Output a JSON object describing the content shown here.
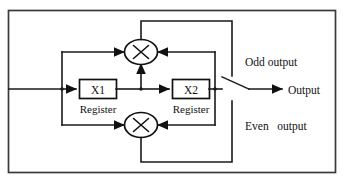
{
  "figure": {
    "kind": "block-diagram",
    "title_text": "",
    "border_color": "#3a3a3a",
    "line_color": "#111111",
    "background": "#ffffff"
  },
  "blocks": {
    "register1": {
      "label": "X1",
      "caption": "Register"
    },
    "register2": {
      "label": "X2",
      "caption": "Register"
    },
    "multiplier_top": {
      "symbol": "×",
      "icon": "multiply-circle-icon"
    },
    "multiplier_bottom": {
      "symbol": "×",
      "icon": "multiply-circle-icon"
    }
  },
  "labels": {
    "odd_output": "Odd output",
    "even_output": "Even   output",
    "output": "Output"
  },
  "signals": {
    "input_arrow": "signal-input",
    "switch": "output-selector-switch"
  }
}
